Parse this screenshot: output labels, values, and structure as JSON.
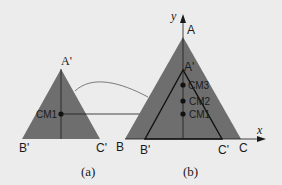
{
  "colors": {
    "background": "#ececec",
    "triangle_fill": "#6e6e6e",
    "line": "#1a1a1a",
    "curve": "#7a7a7a",
    "text": "#1a1a1a"
  },
  "panel_a": {
    "caption": "(a)",
    "apex_label": "A'",
    "left_label": "B'",
    "right_label": "C'",
    "cm_label": "CM1"
  },
  "panel_b": {
    "caption": "(b)",
    "y_axis_label": "y",
    "x_axis_label": "x",
    "outer_apex_label": "A",
    "outer_left_label": "B",
    "outer_right_label": "C",
    "inner_apex_label": "A'",
    "inner_left_label": "B'",
    "inner_right_label": "C'",
    "cm_labels": [
      "CM3",
      "CM2",
      "CM1"
    ]
  }
}
